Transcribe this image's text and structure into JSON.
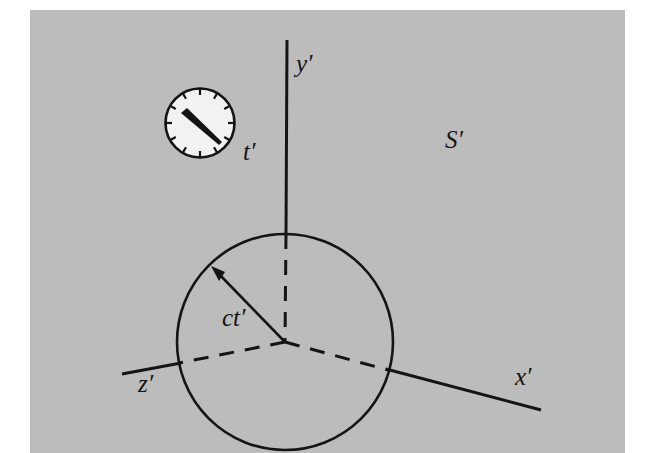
{
  "figure": {
    "name": "spherical-light-wavefront-frame-s-prime",
    "background_color": "#bcbcbc",
    "page_color": "#ffffff",
    "ink_color": "#141414",
    "clock_face_color": "#f2f2f2"
  },
  "labels": {
    "frame": "S′",
    "y_axis": "y′",
    "x_axis": "x′",
    "z_axis": "z′",
    "time": "t′",
    "radius": "ct′"
  },
  "geometry": {
    "origin": {
      "x": 285,
      "y": 342
    },
    "sphere": {
      "cx": 285,
      "cy": 342,
      "r": 108
    },
    "y_axis_tip": {
      "x": 287,
      "y": 40
    },
    "x_axis_tip": {
      "x": 541,
      "y": 410
    },
    "z_axis_tip": {
      "x": 122,
      "y": 374
    },
    "radius_arrow_tip": {
      "x": 213,
      "y": 268
    },
    "clock": {
      "cx": 200,
      "cy": 123,
      "r": 35,
      "tick_count": 12
    }
  },
  "label_positions": {
    "frame": {
      "x": 445,
      "y": 148
    },
    "y_axis": {
      "x": 296,
      "y": 72
    },
    "x_axis": {
      "x": 515,
      "y": 385
    },
    "z_axis": {
      "x": 138,
      "y": 392
    },
    "time": {
      "x": 243,
      "y": 160
    },
    "radius": {
      "x": 222,
      "y": 326
    }
  }
}
